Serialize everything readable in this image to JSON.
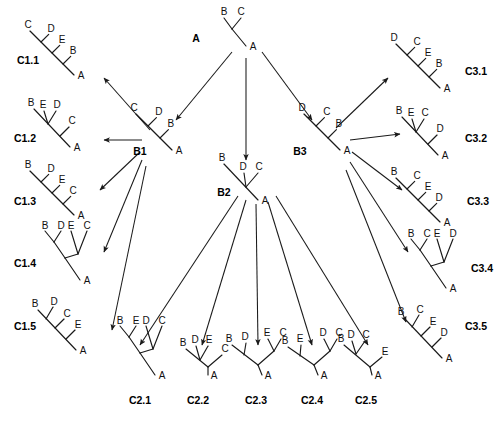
{
  "diagram": {
    "type": "tree-hierarchy",
    "taxa": [
      "A",
      "B",
      "C",
      "D",
      "E"
    ],
    "levels": [
      "A",
      "B",
      "C"
    ],
    "stroke_color": "#1a1a1a",
    "background": "#ffffff"
  },
  "nodes": {
    "root": {
      "name": "A",
      "label": "A",
      "tips": [
        "B",
        "C"
      ],
      "root_tip": "A",
      "x": 240,
      "y": 30
    },
    "b1": {
      "name": "B1",
      "label": "B1",
      "tips": [
        "B",
        "D",
        "C"
      ],
      "root_tip": "A",
      "x": 150,
      "y": 140
    },
    "b2": {
      "name": "B2",
      "label": "B2",
      "tips": [
        "B",
        "D",
        "C"
      ],
      "root_tip": "A",
      "x": 235,
      "y": 185
    },
    "b3": {
      "name": "B3",
      "label": "B3",
      "tips": [
        "B",
        "C",
        "D"
      ],
      "root_tip": "A",
      "x": 318,
      "y": 140
    }
  },
  "leaves": {
    "c1": [
      {
        "name": "C1.1",
        "label": "C1.1",
        "tips": [
          "B",
          "E",
          "D",
          "C"
        ],
        "root_tip": "A"
      },
      {
        "name": "C1.2",
        "label": "C1.2",
        "tips": [
          "B",
          "E",
          "D",
          "C"
        ],
        "root_tip": "A"
      },
      {
        "name": "C1.3",
        "label": "C1.3",
        "tips": [
          "B",
          "D",
          "E",
          "C"
        ],
        "root_tip": "A"
      },
      {
        "name": "C1.4",
        "label": "C1.4",
        "tips": [
          "B",
          "D",
          "E",
          "C"
        ],
        "root_tip": "A"
      },
      {
        "name": "C1.5",
        "label": "C1.5",
        "tips": [
          "B",
          "D",
          "C",
          "E"
        ],
        "root_tip": "A"
      }
    ],
    "c2": [
      {
        "name": "C2.1",
        "label": "C2.1",
        "tips": [
          "B",
          "E",
          "D",
          "C"
        ],
        "root_tip": "A"
      },
      {
        "name": "C2.2",
        "label": "C2.2",
        "tips": [
          "D",
          "E",
          "B",
          "C"
        ],
        "root_tip": "A"
      },
      {
        "name": "C2.3",
        "label": "C2.3",
        "tips": [
          "B",
          "D",
          "E",
          "C"
        ],
        "root_tip": "A"
      },
      {
        "name": "C2.4",
        "label": "C2.4",
        "tips": [
          "B",
          "E",
          "D",
          "C"
        ],
        "root_tip": "A"
      },
      {
        "name": "C2.5",
        "label": "C2.5",
        "tips": [
          "B",
          "D",
          "C",
          "E"
        ],
        "root_tip": "A"
      }
    ],
    "c3": [
      {
        "name": "C3.1",
        "label": "C3.1",
        "tips": [
          "B",
          "E",
          "C",
          "D"
        ],
        "root_tip": "A"
      },
      {
        "name": "C3.2",
        "label": "C3.2",
        "tips": [
          "B",
          "E",
          "C",
          "D"
        ],
        "root_tip": "A"
      },
      {
        "name": "C3.3",
        "label": "C3.3",
        "tips": [
          "B",
          "C",
          "E",
          "D"
        ],
        "root_tip": "A"
      },
      {
        "name": "C3.4",
        "label": "C3.4",
        "tips": [
          "B",
          "C",
          "E",
          "D"
        ],
        "root_tip": "A"
      },
      {
        "name": "C3.5",
        "label": "C3.5",
        "tips": [
          "B",
          "C",
          "E",
          "D"
        ],
        "root_tip": "A"
      }
    ]
  },
  "edges": [
    {
      "from": "A",
      "to": "B1"
    },
    {
      "from": "A",
      "to": "B2"
    },
    {
      "from": "A",
      "to": "B3"
    },
    {
      "from": "B1",
      "to": "C1.1"
    },
    {
      "from": "B1",
      "to": "C1.2"
    },
    {
      "from": "B1",
      "to": "C1.3"
    },
    {
      "from": "B1",
      "to": "C1.4"
    },
    {
      "from": "B1",
      "to": "C1.5"
    },
    {
      "from": "B2",
      "to": "C2.1"
    },
    {
      "from": "B2",
      "to": "C2.2"
    },
    {
      "from": "B2",
      "to": "C2.3"
    },
    {
      "from": "B2",
      "to": "C2.4"
    },
    {
      "from": "B2",
      "to": "C2.5"
    },
    {
      "from": "B3",
      "to": "C3.1"
    },
    {
      "from": "B3",
      "to": "C3.2"
    },
    {
      "from": "B3",
      "to": "C3.3"
    },
    {
      "from": "B3",
      "to": "C3.4"
    },
    {
      "from": "B3",
      "to": "C3.5"
    }
  ],
  "text_labels": {
    "root_name": "A",
    "b1_name": "B1",
    "b2_name": "B2",
    "b3_name": "B3",
    "c11": "C1.1",
    "c12": "C1.2",
    "c13": "C1.3",
    "c14": "C1.4",
    "c15": "C1.5",
    "c21": "C2.1",
    "c22": "C2.2",
    "c23": "C2.3",
    "c24": "C2.4",
    "c25": "C2.5",
    "c31": "C3.1",
    "c32": "C3.2",
    "c33": "C3.3",
    "c34": "C3.4",
    "c35": "C3.5",
    "tip_a": "A",
    "tip_b": "B",
    "tip_c": "C",
    "tip_d": "D",
    "tip_e": "E"
  }
}
